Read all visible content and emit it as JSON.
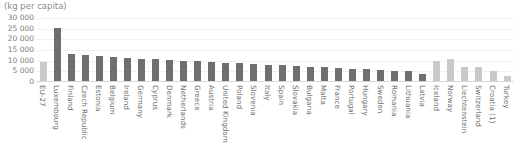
{
  "chart_data": {
    "type": "bar",
    "title": "",
    "subtitle": "",
    "unit_caption": "(kg per capita)",
    "xlabel": "",
    "ylabel": "",
    "ylim": [
      0,
      30000
    ],
    "yticks": [
      "30 000",
      "25 000",
      "20 000",
      "15 000",
      "10 000",
      "5 000",
      "0"
    ],
    "ytick_values": [
      30000,
      25000,
      20000,
      15000,
      10000,
      5000,
      0
    ],
    "grid": true,
    "legend": "none",
    "footnote_markers": [
      "(1)"
    ],
    "categories": [
      "EU-27",
      "Luxembourg",
      "Finland",
      "Czech Republic",
      "Estonia",
      "Belgium",
      "Ireland",
      "Germany",
      "Cyprus",
      "Denmark",
      "Netherlands",
      "Greece",
      "Austria",
      "United Kingdom",
      "Poland",
      "Slovenia",
      "Italy",
      "Spain",
      "Slovakia",
      "Bulgaria",
      "Malta",
      "France",
      "Portugal",
      "Hungary",
      "Sweden",
      "Romania",
      "Lithuania",
      "Latvia",
      "Iceland",
      "Norway",
      "Liechtenstein",
      "Switzerland",
      "Croatia (1)",
      "Turkey"
    ],
    "values": [
      9100,
      25100,
      12900,
      12600,
      12000,
      11300,
      10900,
      10600,
      10300,
      10000,
      9700,
      9400,
      9000,
      8700,
      8400,
      8100,
      7800,
      7400,
      7100,
      6800,
      6500,
      6200,
      5900,
      5600,
      5300,
      5000,
      4600,
      3200,
      9600,
      10600,
      6900,
      6600,
      4600,
      2600
    ],
    "series_shades": [
      "light",
      "dark",
      "dark",
      "dark",
      "dark",
      "dark",
      "dark",
      "dark",
      "dark",
      "dark",
      "dark",
      "dark",
      "dark",
      "dark",
      "dark",
      "dark",
      "dark",
      "dark",
      "dark",
      "dark",
      "dark",
      "dark",
      "dark",
      "dark",
      "dark",
      "dark",
      "dark",
      "dark",
      "light",
      "light",
      "light",
      "light",
      "light",
      "light"
    ],
    "colors": {
      "bar_dark": "#6f6f6f",
      "bar_light": "#c9c9c9",
      "gridline": "#f0f0f0",
      "baseline": "#d8d8d8",
      "text": "#7c7c7c",
      "background": "#ffffff"
    }
  }
}
